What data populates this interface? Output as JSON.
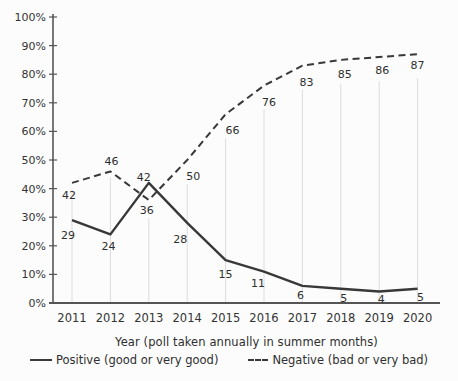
{
  "chart_data": {
    "type": "line",
    "title": "",
    "xlabel": "Year (poll taken annually in summer months)",
    "ylabel": "",
    "x": [
      2011,
      2012,
      2013,
      2014,
      2015,
      2016,
      2017,
      2018,
      2019,
      2020
    ],
    "yticks": [
      0,
      10,
      20,
      30,
      40,
      50,
      60,
      70,
      80,
      90,
      100
    ],
    "ytick_suffix": "%",
    "ylim": [
      0,
      100
    ],
    "grid": "vertical-droplines",
    "legend_position": "bottom",
    "series": [
      {
        "name": "Positive (good or very good)",
        "style": "solid",
        "values": [
          29,
          24,
          42,
          28,
          15,
          11,
          6,
          5,
          4,
          5
        ]
      },
      {
        "name": "Negative (bad or very bad)",
        "style": "dashed",
        "values": [
          42,
          46,
          36,
          50,
          66,
          76,
          83,
          85,
          86,
          87
        ]
      }
    ],
    "colors": {
      "line": "#383838",
      "axis": "#555555",
      "grid": "#dcdcdc",
      "label_text": "#2e2e2e",
      "tick_text": "#333333",
      "background": "#fcfcfc"
    }
  }
}
